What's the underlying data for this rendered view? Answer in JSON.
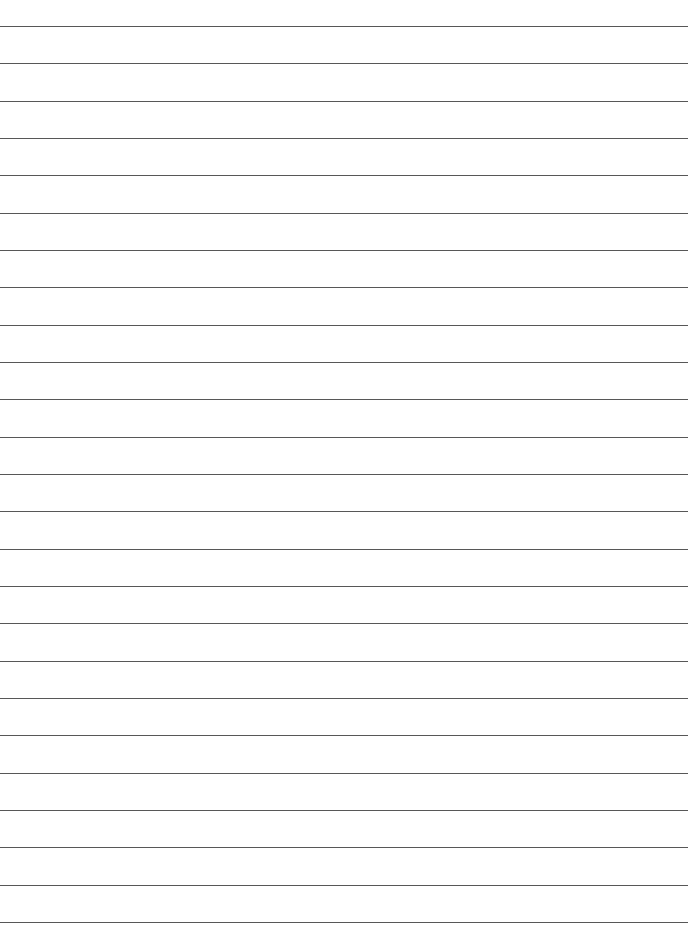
{
  "page": {
    "type": "lined-paper",
    "background": "#ffffff",
    "line_color": "#3a3a3a",
    "line_count": 25,
    "first_line_y": 26,
    "line_spacing": 37.33,
    "line_width": 688
  }
}
